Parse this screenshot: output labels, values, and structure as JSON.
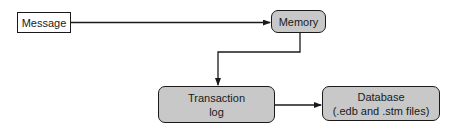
{
  "diagram": {
    "nodes": [
      {
        "id": "message",
        "label": "Message",
        "style": "plain"
      },
      {
        "id": "memory",
        "label": "Memory",
        "style": "rounded"
      },
      {
        "id": "transaction_log",
        "label_line1": "Transaction",
        "label_line2": "log",
        "style": "rounded"
      },
      {
        "id": "database",
        "label_line1": "Database",
        "label_line2": "(.edb and .stm files)",
        "style": "rounded"
      }
    ],
    "edges": [
      {
        "from": "message",
        "to": "memory"
      },
      {
        "from": "memory",
        "to": "transaction_log"
      },
      {
        "from": "transaction_log",
        "to": "database"
      }
    ],
    "colors": {
      "rounded_fill": "#c8c8c8",
      "plain_fill": "#ffffff",
      "stroke": "#1a1a1a"
    }
  }
}
